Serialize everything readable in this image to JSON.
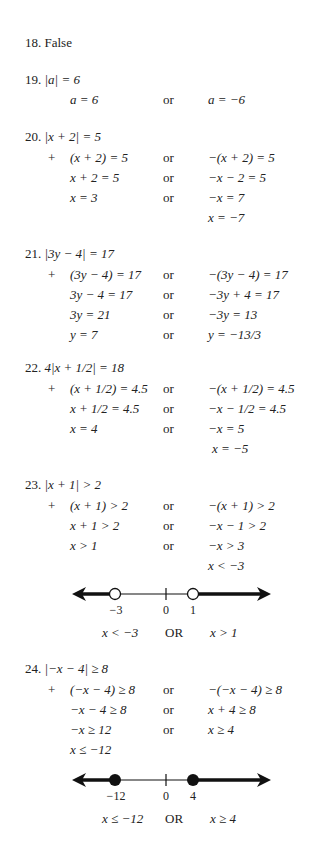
{
  "problems": [
    {
      "number": "18.",
      "answer": "False"
    },
    {
      "number": "19.",
      "equation": "|a| = 6",
      "rows": [
        {
          "left": "a = 6",
          "connector": "or",
          "right": "a = −6"
        }
      ]
    },
    {
      "number": "20.",
      "equation": "|x + 2| = 5",
      "marker": "+",
      "rows": [
        {
          "left": "(x + 2) = 5",
          "connector": "or",
          "right": "−(x + 2) = 5"
        },
        {
          "left": "x + 2 = 5",
          "connector": "or",
          "right": "−x − 2 = 5"
        },
        {
          "left": "x = 3",
          "connector": "or",
          "right": "−x = 7"
        },
        {
          "left": "",
          "connector": "",
          "right": "x = −7"
        }
      ]
    },
    {
      "number": "21.",
      "equation": "|3y − 4| = 17",
      "marker": "+",
      "rows": [
        {
          "left": "(3y − 4) = 17",
          "connector": "or",
          "right": "−(3y − 4) = 17"
        },
        {
          "left": "3y − 4 = 17",
          "connector": "or",
          "right": "−3y + 4 = 17"
        },
        {
          "left": "3y = 21",
          "connector": "or",
          "right": "−3y = 13"
        },
        {
          "left": "y = 7",
          "connector": "or",
          "right": "y = −13/3"
        }
      ]
    },
    {
      "number": "22.",
      "equation": "4|x + 1/2| = 18",
      "marker": "+",
      "rows": [
        {
          "left": "(x + 1/2) = 4.5",
          "connector": "or",
          "right": "−(x + 1/2) = 4.5"
        },
        {
          "left": "x + 1/2 = 4.5",
          "connector": "or",
          "right": "−x − 1/2 = 4.5"
        },
        {
          "left": "x = 4",
          "connector": "or",
          "right": "−x = 5"
        },
        {
          "left": "",
          "connector": "",
          "right": "x = −5"
        }
      ]
    },
    {
      "number": "23.",
      "equation": "|x + 1| > 2",
      "marker": "+",
      "rows": [
        {
          "left": "(x + 1) > 2",
          "connector": "or",
          "right": "−(x + 1) > 2"
        },
        {
          "left": "x + 1 > 2",
          "connector": "or",
          "right": "−x − 1 > 2"
        },
        {
          "left": "x > 1",
          "connector": "or",
          "right": "−x > 3"
        },
        {
          "left": "",
          "connector": "",
          "right": "x < −3"
        }
      ],
      "number_line": {
        "points": [
          {
            "label": "−3",
            "value": -3,
            "type": "open"
          },
          {
            "label": "0",
            "value": 0,
            "type": "tick"
          },
          {
            "label": "1",
            "value": 1,
            "type": "open"
          }
        ],
        "shaded": [
          "left of −3",
          "right of 1"
        ],
        "solution": {
          "left": "x < −3",
          "connector": "OR",
          "right": "x > 1"
        }
      }
    },
    {
      "number": "24.",
      "equation": "|−x − 4| ≥ 8",
      "marker": "+",
      "rows": [
        {
          "left": "(−x − 4) ≥ 8",
          "connector": "or",
          "right": "−(−x − 4) ≥ 8"
        },
        {
          "left": "−x − 4 ≥ 8",
          "connector": "or",
          "right": "x + 4 ≥ 8"
        },
        {
          "left": "−x ≥ 12",
          "connector": "or",
          "right": "x ≥ 4"
        },
        {
          "left": "x ≤ −12",
          "connector": "",
          "right": ""
        }
      ],
      "number_line": {
        "points": [
          {
            "label": "−12",
            "value": -12,
            "type": "closed"
          },
          {
            "label": "0",
            "value": 0,
            "type": "tick"
          },
          {
            "label": "4",
            "value": 4,
            "type": "closed"
          }
        ],
        "shaded": [
          "left of −12",
          "right of 4"
        ],
        "solution": {
          "left": "x ≤ −12",
          "connector": "OR",
          "right": "x ≥ 4"
        }
      }
    }
  ]
}
